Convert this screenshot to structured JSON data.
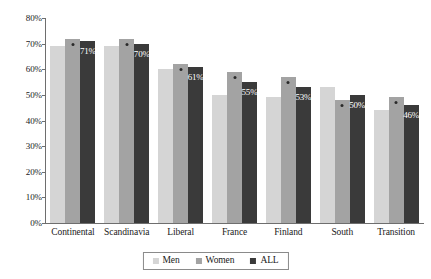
{
  "chart_data": {
    "type": "bar",
    "title": "",
    "subtitle": "",
    "xlabel": "",
    "ylabel": "",
    "ylim": [
      0,
      80
    ],
    "ytick_labels": [
      "80%",
      "70%",
      "60%",
      "50%",
      "40%",
      "30%",
      "20%",
      "10%",
      "0%"
    ],
    "ytick_values": [
      80,
      70,
      60,
      50,
      40,
      30,
      20,
      10,
      0
    ],
    "grid": false,
    "legend_position": "bottom-center",
    "categories": [
      "Continental",
      "Scandinavia",
      "Liberal",
      "France",
      "Finland",
      "South",
      "Transition"
    ],
    "series": [
      {
        "name": "Men",
        "color": "#d5d5d5",
        "values": [
          69,
          69,
          60,
          50,
          49,
          53,
          44
        ],
        "labelled": false
      },
      {
        "name": "Women",
        "color": "#a3a3a3",
        "values": [
          72,
          72,
          62,
          59,
          57,
          48,
          49
        ],
        "labelled": false,
        "marker": true
      },
      {
        "name": "ALL",
        "color": "#3a3a3a",
        "values": [
          71,
          70,
          61,
          55,
          53,
          50,
          46
        ],
        "labelled": true
      }
    ],
    "data_labels": [
      "71%",
      "70%",
      "61%",
      "55%",
      "53%",
      "50%",
      "46%"
    ]
  },
  "legend": {
    "items": [
      {
        "label": "Men",
        "color": "#d5d5d5"
      },
      {
        "label": "Women",
        "color": "#a3a3a3"
      },
      {
        "label": "ALL",
        "color": "#3a3a3a"
      }
    ]
  }
}
